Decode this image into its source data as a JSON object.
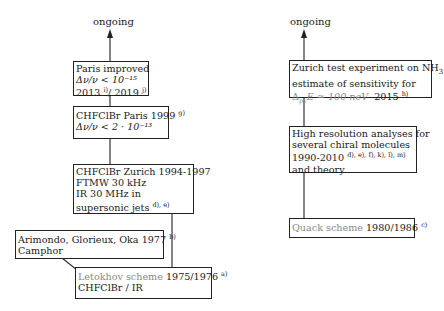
{
  "left_column": {
    "ongoing_label": "ongoing",
    "boxes": [
      {
        "id": "paris-improved",
        "lines": [
          "Paris improved",
          "Δν/ν < 10⁻¹⁵",
          "2013"
        ],
        "refs": [
          "i)",
          "j)"
        ],
        "year2": "/ 2019"
      },
      {
        "id": "chfclbr-paris",
        "line1": "CHFClBr Paris 1999",
        "ref": "g)",
        "line2": "Δν/ν < 2 · 10⁻¹³"
      },
      {
        "id": "chfclbr-zurich",
        "lines": [
          "CHFClBr Zurich 1994-1997",
          "FTMW 30 kHz",
          "IR 30 MHz in",
          "supersonic jets"
        ],
        "ref": "d), e)"
      },
      {
        "id": "arimondo",
        "line1_name": "Arimondo, Glorieux, Oka",
        "line1_year": "1977",
        "ref": "b)",
        "line2": "Camphor"
      },
      {
        "id": "letokhov",
        "scheme": "Letokhov scheme",
        "years": "1975/1976",
        "ref": "a)",
        "line2": "CHFClBr / IR"
      }
    ]
  },
  "right_column": {
    "ongoing_label": "ongoing",
    "boxes": [
      {
        "id": "zurich-test",
        "line1": "Zurich test experiment on NH",
        "line1_sub": "3",
        "line1_end": ",",
        "line2": "estimate of sensitivity for",
        "line3_math": "Δ",
        "line3_sub": "pv",
        "line3_rest": "E ≃ 100 neV",
        "line3_year": "2015",
        "ref": "h)"
      },
      {
        "id": "high-resolution",
        "lines": [
          "High resolution analyses for",
          "several chiral molecules",
          "1990-2010",
          "and theory"
        ],
        "ref": "d), e), f), k), l), m)"
      },
      {
        "id": "quack",
        "scheme": "Quack scheme",
        "years": "1980/1986",
        "ref": "c)"
      }
    ]
  },
  "colors": {
    "line": "#333333",
    "gray_text": "#8a8a8a"
  }
}
